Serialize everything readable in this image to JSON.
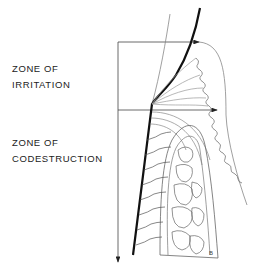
{
  "labels": {
    "zone_irritation": [
      "ZONE OF",
      "IRRITATION"
    ],
    "zone_codestruction": [
      "ZONE OF",
      "CODESTRUCTION"
    ]
  },
  "figure": {
    "mark": "B",
    "colors": {
      "ink": "#1a1a1a",
      "thin_line": "#888888",
      "background": "#ffffff"
    }
  }
}
